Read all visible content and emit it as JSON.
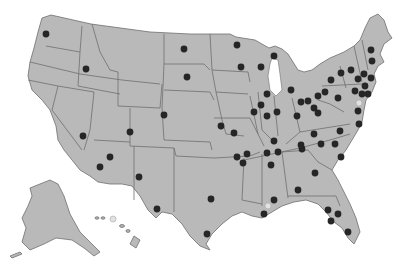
{
  "map": {
    "title": "",
    "region": "United States",
    "colors": {
      "land": "#b9b9b9",
      "border": "#6e6e6e",
      "marker": "#262626",
      "marker_light": "#e2e2e2",
      "background": "#ffffff"
    },
    "markers": [
      {
        "x": 46,
        "y": 34
      },
      {
        "x": 86,
        "y": 69
      },
      {
        "x": 184,
        "y": 49
      },
      {
        "x": 187,
        "y": 77
      },
      {
        "x": 164,
        "y": 115
      },
      {
        "x": 130,
        "y": 132
      },
      {
        "x": 83,
        "y": 136
      },
      {
        "x": 110,
        "y": 157
      },
      {
        "x": 100,
        "y": 167
      },
      {
        "x": 139,
        "y": 177
      },
      {
        "x": 157,
        "y": 209
      },
      {
        "x": 237,
        "y": 45
      },
      {
        "x": 241,
        "y": 67
      },
      {
        "x": 261,
        "y": 67
      },
      {
        "x": 274,
        "y": 56
      },
      {
        "x": 221,
        "y": 126
      },
      {
        "x": 234,
        "y": 133
      },
      {
        "x": 267,
        "y": 94
      },
      {
        "x": 261,
        "y": 105
      },
      {
        "x": 254,
        "y": 112
      },
      {
        "x": 267,
        "y": 116
      },
      {
        "x": 277,
        "y": 112
      },
      {
        "x": 291,
        "y": 90
      },
      {
        "x": 301,
        "y": 102
      },
      {
        "x": 297,
        "y": 116
      },
      {
        "x": 314,
        "y": 108
      },
      {
        "x": 308,
        "y": 101
      },
      {
        "x": 318,
        "y": 96
      },
      {
        "x": 318,
        "y": 113
      },
      {
        "x": 325,
        "y": 92
      },
      {
        "x": 338,
        "y": 98
      },
      {
        "x": 331,
        "y": 80
      },
      {
        "x": 341,
        "y": 73
      },
      {
        "x": 351,
        "y": 70
      },
      {
        "x": 358,
        "y": 79
      },
      {
        "x": 364,
        "y": 74
      },
      {
        "x": 371,
        "y": 78
      },
      {
        "x": 365,
        "y": 86
      },
      {
        "x": 355,
        "y": 91
      },
      {
        "x": 362,
        "y": 94
      },
      {
        "x": 368,
        "y": 94
      },
      {
        "x": 372,
        "y": 61
      },
      {
        "x": 371,
        "y": 50
      },
      {
        "x": 358,
        "y": 111
      },
      {
        "x": 359,
        "y": 124
      },
      {
        "x": 340,
        "y": 131
      },
      {
        "x": 314,
        "y": 134
      },
      {
        "x": 321,
        "y": 144
      },
      {
        "x": 302,
        "y": 149
      },
      {
        "x": 278,
        "y": 152
      },
      {
        "x": 274,
        "y": 141
      },
      {
        "x": 237,
        "y": 157
      },
      {
        "x": 247,
        "y": 154
      },
      {
        "x": 267,
        "y": 153
      },
      {
        "x": 271,
        "y": 165
      },
      {
        "x": 301,
        "y": 145
      },
      {
        "x": 315,
        "y": 173
      },
      {
        "x": 335,
        "y": 144
      },
      {
        "x": 341,
        "y": 157
      },
      {
        "x": 298,
        "y": 190
      },
      {
        "x": 274,
        "y": 200
      },
      {
        "x": 264,
        "y": 214
      },
      {
        "x": 328,
        "y": 210
      },
      {
        "x": 338,
        "y": 214
      },
      {
        "x": 331,
        "y": 221
      },
      {
        "x": 348,
        "y": 232
      },
      {
        "x": 211,
        "y": 199
      },
      {
        "x": 207,
        "y": 234
      },
      {
        "x": 243,
        "y": 163
      }
    ],
    "light_markers": [
      {
        "x": 359,
        "y": 103
      },
      {
        "x": 268,
        "y": 206
      },
      {
        "x": 113,
        "y": 219
      }
    ]
  }
}
